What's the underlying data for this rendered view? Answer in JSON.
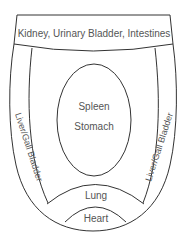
{
  "diagram": {
    "regions": {
      "top": "Kidney, Urinary Bladder, Intestines",
      "center_1": "Spleen",
      "center_2": "Stomach",
      "left": "Liver/Gall Bladder",
      "right": "Liver/Gall Bladder",
      "lower": "Lung",
      "bottom": "Heart"
    },
    "colors": {
      "line": "#333333",
      "text": "#555555",
      "background": "#ffffff"
    }
  }
}
